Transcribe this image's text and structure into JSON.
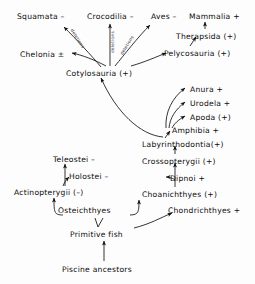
{
  "diagram": {
    "background_color": "#fdfdfd",
    "text_color": "#0b0b0b",
    "line_color": "#111111",
    "nodes": [
      {
        "id": "squamata",
        "label": "Squamata –",
        "x": 17,
        "y": 12
      },
      {
        "id": "crocodilia",
        "label": "Crocodilia –",
        "x": 87,
        "y": 12
      },
      {
        "id": "aves",
        "label": "Aves –",
        "x": 151,
        "y": 12
      },
      {
        "id": "mammalia",
        "label": "Mammalia +",
        "x": 189,
        "y": 12
      },
      {
        "id": "therapsida",
        "label": "Therapsida (+)",
        "x": 176,
        "y": 32
      },
      {
        "id": "chelonia",
        "label": "Chelonia ±",
        "x": 20,
        "y": 50
      },
      {
        "id": "pelycosauria",
        "label": "Pelycosauria (+)",
        "x": 164,
        "y": 49
      },
      {
        "id": "cotylosauria",
        "label": "Cotylosauria (+)",
        "x": 66,
        "y": 69
      },
      {
        "id": "anura",
        "label": "Anura +",
        "x": 190,
        "y": 85
      },
      {
        "id": "urodela",
        "label": "Urodela +",
        "x": 190,
        "y": 99
      },
      {
        "id": "apoda",
        "label": "Apoda (+)",
        "x": 190,
        "y": 113
      },
      {
        "id": "amphibia",
        "label": "Amphibia +",
        "x": 172,
        "y": 126
      },
      {
        "id": "labyrinthodontia",
        "label": "Labyrinthodontia(+)",
        "x": 142,
        "y": 140
      },
      {
        "id": "crossopterygii",
        "label": "Crossopterygii (+)",
        "x": 142,
        "y": 157
      },
      {
        "id": "teleostei",
        "label": "Teleostei –",
        "x": 53,
        "y": 155
      },
      {
        "id": "holostei",
        "label": "Holostei –",
        "x": 69,
        "y": 172
      },
      {
        "id": "dipnoi",
        "label": "Dipnoi +",
        "x": 170,
        "y": 174
      },
      {
        "id": "actinopterygii",
        "label": "Actinopterygii (–)",
        "x": 14,
        "y": 188
      },
      {
        "id": "choanichthyes",
        "label": "Choanichthyes (+)",
        "x": 142,
        "y": 190
      },
      {
        "id": "osteichthyes",
        "label": "Osteichthyes",
        "x": 58,
        "y": 206
      },
      {
        "id": "chondrichthyes",
        "label": "Chondrichthyes +",
        "x": 168,
        "y": 206
      },
      {
        "id": "primitivefish",
        "label": "Primitive fish",
        "x": 70,
        "y": 230
      },
      {
        "id": "piscine",
        "label": "Piscine ancestors",
        "x": 62,
        "y": 265
      }
    ],
    "edge_labels": [
      {
        "id": "deletions-squamata",
        "text": "deletions",
        "x": 74,
        "y": 28,
        "rotate": 58
      },
      {
        "id": "deletions-crocodilia",
        "text": "deletions",
        "x": 110,
        "y": 53,
        "rotate": -90
      },
      {
        "id": "deletions-aves",
        "text": "deletions",
        "x": 119,
        "y": 53,
        "rotate": -58
      }
    ]
  }
}
